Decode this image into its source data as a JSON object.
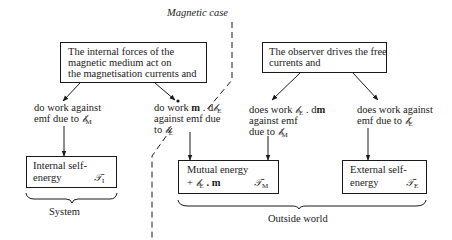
{
  "title": "Magnetic case",
  "boxes": {
    "internal_forces": {
      "lines": [
        "The internal forces of the",
        "magnetic medium act on",
        "the magnetisation currents and"
      ]
    },
    "observer": {
      "lines": [
        "The observer drives the free",
        "currents and"
      ]
    },
    "internal_self_energy": {
      "line1": "Internal self-",
      "line2": "energy",
      "symbol": "𝒯",
      "symbol_sub": "I"
    },
    "mutual_energy": {
      "line1": "Mutual energy",
      "line2_prefix": "+ ",
      "line2_symbol": "𝒷",
      "line2_sub": "E",
      "line2_suffix": " . m",
      "symbol": "𝒯",
      "symbol_sub": "M"
    },
    "external_self_energy": {
      "line1": "External self-",
      "line2": "energy",
      "symbol": "𝒯",
      "symbol_sub": "E"
    }
  },
  "labels": {
    "work_against_bm": {
      "line1": "do work against",
      "line2_prefix": "emf due to ",
      "symbol": "𝒷̇",
      "sub": "M"
    },
    "work_m_dbe": {
      "line1_prefix": "do work ",
      "line1_bold": "m",
      "line1_mid": " . d",
      "line1_symbol": "𝒷",
      "line1_sub": "E",
      "line2": "against emf due",
      "line3_prefix": "to ",
      "line3_symbol": "𝒷̇",
      "line3_sub": "E"
    },
    "work_be_dm": {
      "line1_prefix": "does work ",
      "line1_symbol": "𝒷",
      "line1_sub": "E",
      "line1_suffix": " . d",
      "line1_bold": "m",
      "line2": "against emf",
      "line3_prefix": "due to ",
      "line3_symbol": "𝒷̇",
      "line3_sub": "M"
    },
    "work_against_be": {
      "line1": "does work against",
      "line2_prefix": "emf due to ",
      "symbol": "𝒷̇",
      "sub": "E"
    }
  },
  "groups": {
    "system": "System",
    "outside_world": "Outside world"
  }
}
